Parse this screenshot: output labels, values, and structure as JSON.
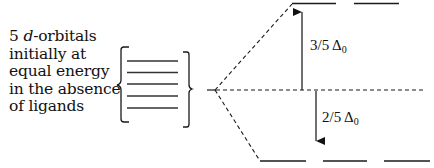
{
  "caption": {
    "lines": [
      {
        "number": "5",
        "italic": "d",
        "rest": "-orbitals"
      },
      "initially at",
      "equal energy",
      "in the absence",
      "of ligands"
    ]
  },
  "labels": {
    "upper": {
      "fraction": "3/5 Δ",
      "subscript": "0"
    },
    "lower": {
      "fraction": "2/5 Δ",
      "subscript": "0"
    }
  },
  "diagram": {
    "degenerate_orbital_count": 5,
    "upper_level_orbital_count": 2,
    "lower_level_orbital_count": 3,
    "line_color": "#1a1a1a"
  }
}
